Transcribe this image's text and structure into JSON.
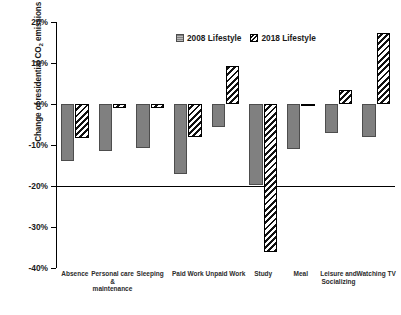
{
  "chart_data": {
    "type": "bar",
    "title": "",
    "xlabel": "",
    "ylabel": "Change of residential CO2 emissions (%)",
    "ylabel_prefix": "Change of residential CO",
    "ylabel_sub": "2",
    "ylabel_suffix": " emissions (%)",
    "ylim": [
      -40,
      20
    ],
    "yticks": [
      20,
      10,
      0,
      -10,
      -20,
      -30,
      -40
    ],
    "ytick_labels": [
      "20%",
      "10%",
      "0%",
      "-10%",
      "-20%",
      "-30%",
      "-40%"
    ],
    "grid": false,
    "legend_position": "top-center",
    "categories": [
      "Absence",
      "Personal care & maintenance",
      "Sleeping",
      "Paid Work",
      "Unpaid Work",
      "Study",
      "Meal",
      "Leisure and Socializing",
      "Watching TV"
    ],
    "category_lines": [
      [
        "Absence"
      ],
      [
        "Personal care",
        "&",
        "maintenance"
      ],
      [
        "Sleeping"
      ],
      [
        "Paid Work"
      ],
      [
        "Unpaid Work"
      ],
      [
        "Study"
      ],
      [
        "Meal"
      ],
      [
        "Leisure and",
        "Socializing"
      ],
      [
        "Watching TV"
      ]
    ],
    "series": [
      {
        "name": "2008 Lifestyle",
        "color": "#808080",
        "pattern": "solid-grey",
        "values": [
          -14.0,
          -11.5,
          -10.8,
          -17.0,
          -5.5,
          -19.7,
          -11.0,
          -7.0,
          -8.0
        ]
      },
      {
        "name": "2018 Lifestyle",
        "color": "#ffffff",
        "pattern": "diagonal-hatch",
        "values": [
          -8.2,
          -1.0,
          -1.0,
          -8.0,
          9.2,
          -36.0,
          -0.4,
          3.5,
          17.2
        ]
      }
    ]
  },
  "legend": {
    "items": [
      {
        "label": "2008 Lifestyle",
        "swatch": "solid-grey-swatch"
      },
      {
        "label": "2018 Lifestyle",
        "swatch": "diagonal-hatch-swatch"
      }
    ]
  },
  "caption": {
    "text": ""
  }
}
